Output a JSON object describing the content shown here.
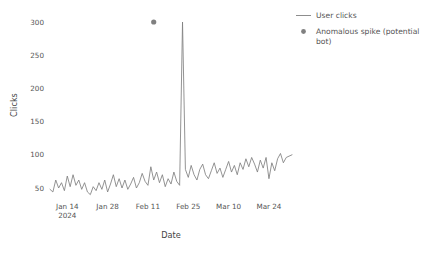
{
  "chart_data": {
    "type": "line",
    "title": "",
    "xlabel": "Date",
    "ylabel": "Clicks",
    "grid": false,
    "legend_position": "upper right outside",
    "ylim": [
      30,
      310
    ],
    "ytick_labels": [
      "50",
      "100",
      "150",
      "200",
      "250",
      "300"
    ],
    "ytick_values": [
      50,
      100,
      150,
      200,
      250,
      300
    ],
    "xtick_labels": [
      "Jan 14",
      "Jan 28",
      "Feb 11",
      "Feb 25",
      "Mar 10",
      "Mar 24"
    ],
    "xtick_sublabel": "2024",
    "xtick_dates": [
      "2024-01-14",
      "2024-01-28",
      "2024-02-11",
      "2024-02-25",
      "2024-03-10",
      "2024-03-24"
    ],
    "x_start": "2024-01-08",
    "x_end": "2024-04-01",
    "series": [
      {
        "name": "User clicks",
        "color": "#808080",
        "marker": "none",
        "x": [
          "2024-01-08",
          "2024-01-09",
          "2024-01-10",
          "2024-01-11",
          "2024-01-12",
          "2024-01-13",
          "2024-01-14",
          "2024-01-15",
          "2024-01-16",
          "2024-01-17",
          "2024-01-18",
          "2024-01-19",
          "2024-01-20",
          "2024-01-21",
          "2024-01-22",
          "2024-01-23",
          "2024-01-24",
          "2024-01-25",
          "2024-01-26",
          "2024-01-27",
          "2024-01-28",
          "2024-01-29",
          "2024-01-30",
          "2024-01-31",
          "2024-02-01",
          "2024-02-02",
          "2024-02-03",
          "2024-02-04",
          "2024-02-05",
          "2024-02-06",
          "2024-02-07",
          "2024-02-08",
          "2024-02-09",
          "2024-02-10",
          "2024-02-11",
          "2024-02-12",
          "2024-02-13",
          "2024-02-14",
          "2024-02-15",
          "2024-02-16",
          "2024-02-17",
          "2024-02-18",
          "2024-02-19",
          "2024-02-20",
          "2024-02-21",
          "2024-02-22",
          "2024-02-23",
          "2024-02-24",
          "2024-02-25",
          "2024-02-26",
          "2024-02-27",
          "2024-02-28",
          "2024-02-29",
          "2024-03-01",
          "2024-03-02",
          "2024-03-03",
          "2024-03-04",
          "2024-03-05",
          "2024-03-06",
          "2024-03-07",
          "2024-03-08",
          "2024-03-09",
          "2024-03-10",
          "2024-03-11",
          "2024-03-12",
          "2024-03-13",
          "2024-03-14",
          "2024-03-15",
          "2024-03-16",
          "2024-03-17",
          "2024-03-18",
          "2024-03-19",
          "2024-03-20",
          "2024-03-21",
          "2024-03-22",
          "2024-03-23",
          "2024-03-24",
          "2024-03-25",
          "2024-03-26",
          "2024-03-27",
          "2024-03-28",
          "2024-03-29",
          "2024-03-30",
          "2024-04-01"
        ],
        "values": [
          48,
          44,
          62,
          50,
          58,
          46,
          68,
          52,
          70,
          54,
          62,
          48,
          58,
          44,
          40,
          52,
          46,
          58,
          48,
          62,
          44,
          56,
          70,
          52,
          64,
          50,
          62,
          48,
          56,
          66,
          50,
          58,
          72,
          60,
          54,
          82,
          62,
          74,
          58,
          70,
          52,
          64,
          56,
          74,
          60,
          54,
          300,
          78,
          66,
          84,
          70,
          62,
          78,
          86,
          70,
          64,
          76,
          88,
          72,
          80,
          66,
          78,
          90,
          74,
          84,
          70,
          88,
          78,
          94,
          82,
          96,
          86,
          74,
          92,
          80,
          96,
          64,
          88,
          76,
          94,
          102,
          88,
          96,
          100
        ]
      }
    ],
    "annotations": [
      {
        "name": "Anomalous spike (potential bot)",
        "x": "2024-02-13",
        "y": 300,
        "marker": "circle",
        "color": "#808080"
      }
    ],
    "legend": [
      {
        "label": "User clicks",
        "marker": "line",
        "color": "#808080"
      },
      {
        "label": "Anomalous spike (potential bot)",
        "marker": "dot",
        "color": "#808080"
      }
    ]
  },
  "legend_lines": {
    "item1": "User clicks",
    "item2_line1": "Anomalous spike (potential",
    "item2_line2": "bot)"
  },
  "colors": {
    "line": "#808080",
    "marker": "#808080",
    "text": "#555555",
    "background": "#ffffff"
  }
}
